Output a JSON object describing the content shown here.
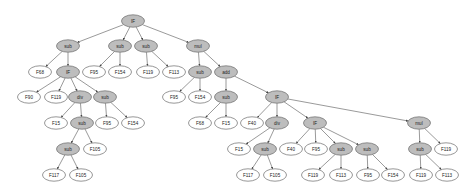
{
  "diagram": {
    "type": "expression-tree",
    "node_style": {
      "operator_fill": "#bdbdbd",
      "leaf_fill": "#ffffff",
      "stroke": "#6a6a6a",
      "edge": "#555555"
    },
    "nodes": [
      {
        "id": "n0",
        "label": "IF",
        "kind": "op",
        "x": 133,
        "y": 21
      },
      {
        "id": "n1",
        "label": "sub",
        "kind": "op",
        "x": 68,
        "y": 46
      },
      {
        "id": "n2",
        "label": "sub",
        "kind": "op",
        "x": 120,
        "y": 46
      },
      {
        "id": "n3",
        "label": "sub",
        "kind": "op",
        "x": 146,
        "y": 46
      },
      {
        "id": "n4",
        "label": "mul",
        "kind": "op",
        "x": 198,
        "y": 46
      },
      {
        "id": "n5",
        "label": "F68",
        "kind": "leaf",
        "x": 40,
        "y": 72
      },
      {
        "id": "n6",
        "label": "IF",
        "kind": "op",
        "x": 68,
        "y": 72
      },
      {
        "id": "n7",
        "label": "F95",
        "kind": "leaf",
        "x": 94,
        "y": 72
      },
      {
        "id": "n8",
        "label": "F154",
        "kind": "leaf",
        "x": 120,
        "y": 72
      },
      {
        "id": "n9",
        "label": "F119",
        "kind": "leaf",
        "x": 148,
        "y": 72
      },
      {
        "id": "n10",
        "label": "F113",
        "kind": "leaf",
        "x": 174,
        "y": 72
      },
      {
        "id": "n11",
        "label": "sub",
        "kind": "op",
        "x": 200,
        "y": 72
      },
      {
        "id": "n12",
        "label": "add",
        "kind": "op",
        "x": 226,
        "y": 72
      },
      {
        "id": "n13",
        "label": "F90",
        "kind": "leaf",
        "x": 29,
        "y": 97
      },
      {
        "id": "n14",
        "label": "F119",
        "kind": "leaf",
        "x": 56,
        "y": 97
      },
      {
        "id": "n15",
        "label": "div",
        "kind": "op",
        "x": 80,
        "y": 97
      },
      {
        "id": "n16",
        "label": "sub",
        "kind": "op",
        "x": 105,
        "y": 97
      },
      {
        "id": "n17",
        "label": "F95",
        "kind": "leaf",
        "x": 174,
        "y": 97
      },
      {
        "id": "n18",
        "label": "F154",
        "kind": "leaf",
        "x": 200,
        "y": 97
      },
      {
        "id": "n19",
        "label": "sub",
        "kind": "op",
        "x": 226,
        "y": 97
      },
      {
        "id": "n20",
        "label": "IF",
        "kind": "op",
        "x": 277,
        "y": 97
      },
      {
        "id": "n21",
        "label": "F15",
        "kind": "leaf",
        "x": 56,
        "y": 123
      },
      {
        "id": "n22",
        "label": "sub",
        "kind": "op",
        "x": 82,
        "y": 123
      },
      {
        "id": "n23",
        "label": "F95",
        "kind": "leaf",
        "x": 107,
        "y": 123
      },
      {
        "id": "n24",
        "label": "F154",
        "kind": "leaf",
        "x": 133,
        "y": 123
      },
      {
        "id": "n25",
        "label": "F68",
        "kind": "leaf",
        "x": 200,
        "y": 123
      },
      {
        "id": "n26",
        "label": "F15",
        "kind": "leaf",
        "x": 226,
        "y": 123
      },
      {
        "id": "n27",
        "label": "F40",
        "kind": "leaf",
        "x": 252,
        "y": 123
      },
      {
        "id": "n28",
        "label": "div",
        "kind": "op",
        "x": 277,
        "y": 123
      },
      {
        "id": "n29",
        "label": "IF",
        "kind": "op",
        "x": 315,
        "y": 123
      },
      {
        "id": "n30",
        "label": "mul",
        "kind": "op",
        "x": 419,
        "y": 123
      },
      {
        "id": "n31",
        "label": "sub",
        "kind": "op",
        "x": 68,
        "y": 149
      },
      {
        "id": "n32",
        "label": "F105",
        "kind": "leaf",
        "x": 95,
        "y": 149
      },
      {
        "id": "n33",
        "label": "F15",
        "kind": "leaf",
        "x": 239,
        "y": 149
      },
      {
        "id": "n34",
        "label": "sub",
        "kind": "op",
        "x": 265,
        "y": 149
      },
      {
        "id": "n35",
        "label": "F40",
        "kind": "leaf",
        "x": 291,
        "y": 149
      },
      {
        "id": "n36",
        "label": "F95",
        "kind": "leaf",
        "x": 316,
        "y": 149
      },
      {
        "id": "n37",
        "label": "sub",
        "kind": "op",
        "x": 341,
        "y": 149
      },
      {
        "id": "n38",
        "label": "sub",
        "kind": "op",
        "x": 367,
        "y": 149
      },
      {
        "id": "n39",
        "label": "sub",
        "kind": "op",
        "x": 420,
        "y": 149
      },
      {
        "id": "n40",
        "label": "F119",
        "kind": "leaf",
        "x": 446,
        "y": 149
      },
      {
        "id": "n41",
        "label": "F117",
        "kind": "leaf",
        "x": 54,
        "y": 175
      },
      {
        "id": "n42",
        "label": "F105",
        "kind": "leaf",
        "x": 81,
        "y": 175
      },
      {
        "id": "n43",
        "label": "F117",
        "kind": "leaf",
        "x": 248,
        "y": 175
      },
      {
        "id": "n44",
        "label": "F105",
        "kind": "leaf",
        "x": 275,
        "y": 175
      },
      {
        "id": "n45",
        "label": "F119",
        "kind": "leaf",
        "x": 313,
        "y": 175
      },
      {
        "id": "n46",
        "label": "F113",
        "kind": "leaf",
        "x": 341,
        "y": 175
      },
      {
        "id": "n47",
        "label": "F95",
        "kind": "leaf",
        "x": 368,
        "y": 175
      },
      {
        "id": "n48",
        "label": "F154",
        "kind": "leaf",
        "x": 393,
        "y": 175
      },
      {
        "id": "n49",
        "label": "F119",
        "kind": "leaf",
        "x": 421,
        "y": 175
      },
      {
        "id": "n50",
        "label": "F113",
        "kind": "leaf",
        "x": 447,
        "y": 175
      }
    ],
    "edges": [
      [
        "n0",
        "n1"
      ],
      [
        "n0",
        "n2"
      ],
      [
        "n0",
        "n3"
      ],
      [
        "n0",
        "n4"
      ],
      [
        "n1",
        "n5"
      ],
      [
        "n1",
        "n6"
      ],
      [
        "n2",
        "n7"
      ],
      [
        "n2",
        "n8"
      ],
      [
        "n3",
        "n9"
      ],
      [
        "n3",
        "n10"
      ],
      [
        "n4",
        "n11"
      ],
      [
        "n4",
        "n12"
      ],
      [
        "n6",
        "n13"
      ],
      [
        "n6",
        "n14"
      ],
      [
        "n6",
        "n15"
      ],
      [
        "n6",
        "n16"
      ],
      [
        "n11",
        "n17"
      ],
      [
        "n11",
        "n18"
      ],
      [
        "n12",
        "n19"
      ],
      [
        "n12",
        "n20"
      ],
      [
        "n15",
        "n21"
      ],
      [
        "n15",
        "n22"
      ],
      [
        "n16",
        "n23"
      ],
      [
        "n16",
        "n24"
      ],
      [
        "n19",
        "n25"
      ],
      [
        "n19",
        "n26"
      ],
      [
        "n20",
        "n27"
      ],
      [
        "n20",
        "n28"
      ],
      [
        "n20",
        "n29"
      ],
      [
        "n20",
        "n30"
      ],
      [
        "n22",
        "n31"
      ],
      [
        "n22",
        "n32"
      ],
      [
        "n28",
        "n33"
      ],
      [
        "n28",
        "n34"
      ],
      [
        "n29",
        "n35"
      ],
      [
        "n29",
        "n36"
      ],
      [
        "n29",
        "n37"
      ],
      [
        "n29",
        "n38"
      ],
      [
        "n30",
        "n39"
      ],
      [
        "n30",
        "n40"
      ],
      [
        "n31",
        "n41"
      ],
      [
        "n31",
        "n42"
      ],
      [
        "n34",
        "n43"
      ],
      [
        "n34",
        "n44"
      ],
      [
        "n37",
        "n45"
      ],
      [
        "n37",
        "n46"
      ],
      [
        "n38",
        "n47"
      ],
      [
        "n38",
        "n48"
      ],
      [
        "n39",
        "n49"
      ],
      [
        "n39",
        "n50"
      ]
    ]
  }
}
